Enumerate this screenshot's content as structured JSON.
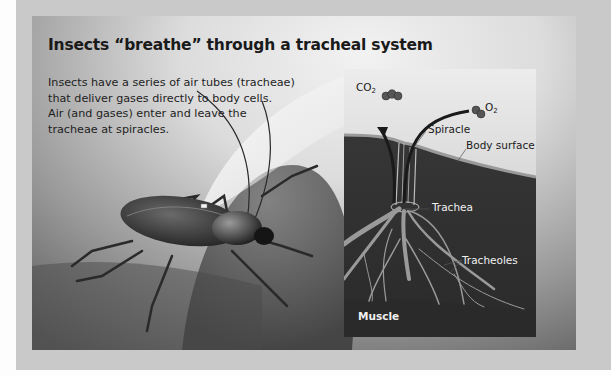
{
  "title": "Insects “breathe” through a tracheal system",
  "description": [
    "Insects have a series of air tubes (tracheae)",
    "that deliver gases directly to body cells.",
    "Air (and gases) enter and leave the",
    "tracheae at spiracles."
  ],
  "inset": {
    "labels": {
      "co2_main": "CO",
      "co2_sub": "2",
      "o2_main": "O",
      "o2_sub": "2",
      "spiracle": "Spiracle",
      "body_surface": "Body surface",
      "trachea": "Trachea",
      "tracheoles": "Tracheoles",
      "muscle": "Muscle"
    }
  },
  "colors": {
    "outer_frame": "#c9c9c9",
    "title_text": "#1a1a1a",
    "inset_sky": "#e6e6e6",
    "inset_tissue": "#2f2f2f"
  }
}
